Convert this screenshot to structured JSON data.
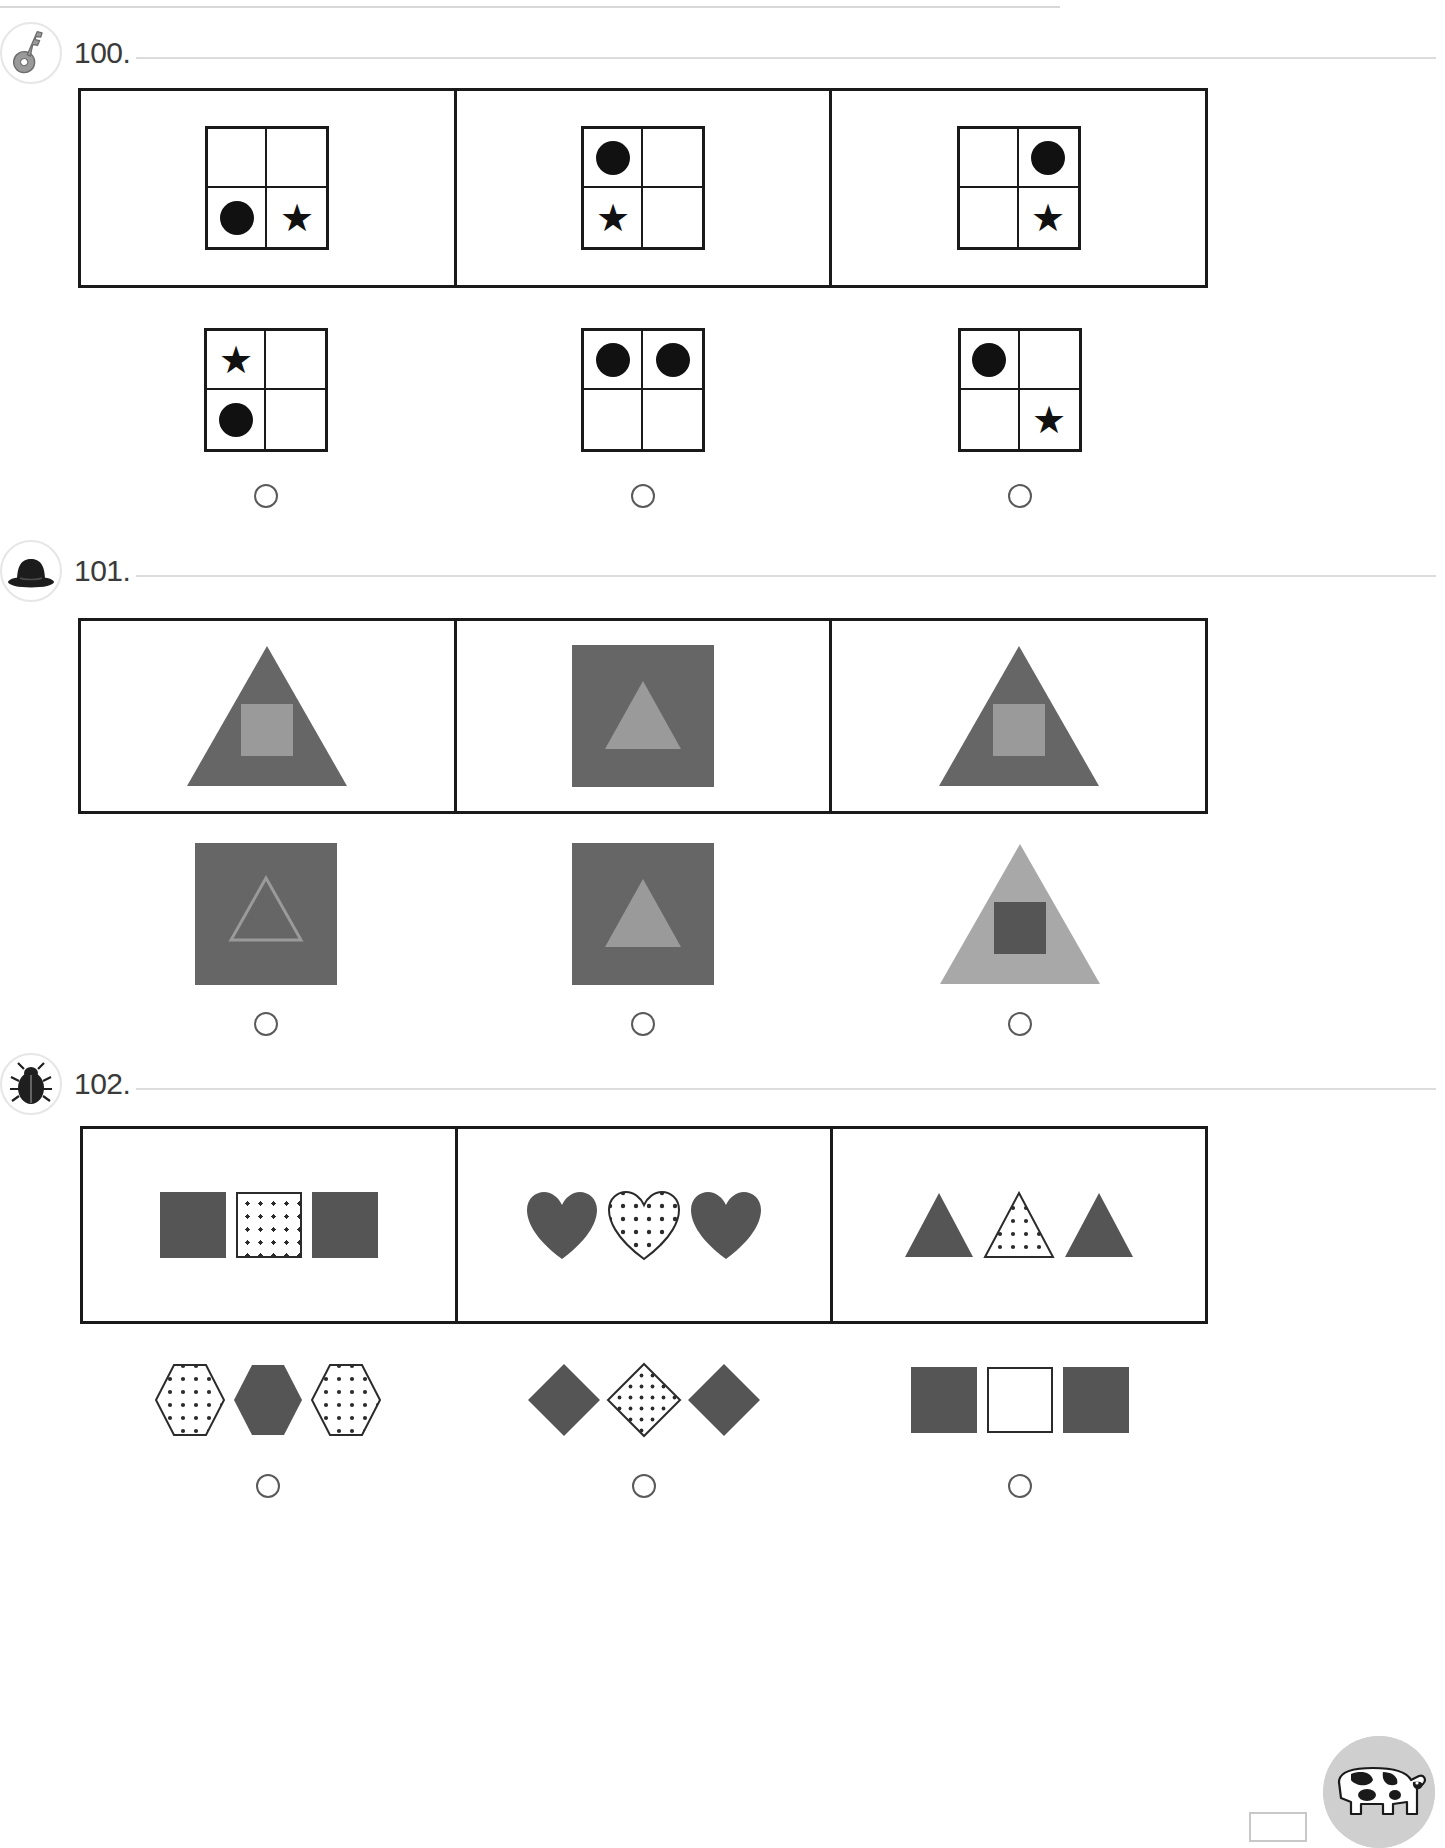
{
  "page": {
    "width": 1445,
    "height": 1848,
    "background": "#ffffff",
    "rule_color": "#d8d8d8",
    "frame_color": "#1a1a1a",
    "bubble_color": "#5a5a5a",
    "dark_gray": "#666666",
    "mid_gray": "#9a9a9a",
    "light_gray": "#a8a8a8",
    "shape_gray": "#555555",
    "black": "#111111"
  },
  "footer": {
    "mascot_icon": "cow-icon",
    "page_number_box": ""
  },
  "exercises": [
    {
      "number": "100.",
      "badge_icon": "key-icon",
      "type": "grid-pattern",
      "question_items": [
        {
          "name": "grid-q1",
          "cells": [
            {
              "pos": "top-left",
              "shape": "empty"
            },
            {
              "pos": "top-right",
              "shape": "empty"
            },
            {
              "pos": "bottom-left",
              "shape": "circle"
            },
            {
              "pos": "bottom-right",
              "shape": "star"
            }
          ]
        },
        {
          "name": "grid-q2",
          "cells": [
            {
              "pos": "top-left",
              "shape": "circle"
            },
            {
              "pos": "top-right",
              "shape": "empty"
            },
            {
              "pos": "bottom-left",
              "shape": "star"
            },
            {
              "pos": "bottom-right",
              "shape": "empty"
            }
          ]
        },
        {
          "name": "grid-q3",
          "cells": [
            {
              "pos": "top-left",
              "shape": "empty"
            },
            {
              "pos": "top-right",
              "shape": "circle"
            },
            {
              "pos": "bottom-left",
              "shape": "empty"
            },
            {
              "pos": "bottom-right",
              "shape": "star"
            }
          ]
        }
      ],
      "answer_items": [
        {
          "name": "grid-a1",
          "cells": [
            {
              "pos": "top-left",
              "shape": "star"
            },
            {
              "pos": "top-right",
              "shape": "empty"
            },
            {
              "pos": "bottom-left",
              "shape": "circle"
            },
            {
              "pos": "bottom-right",
              "shape": "empty"
            }
          ]
        },
        {
          "name": "grid-a2",
          "cells": [
            {
              "pos": "top-left",
              "shape": "circle"
            },
            {
              "pos": "top-right",
              "shape": "circle"
            },
            {
              "pos": "bottom-left",
              "shape": "empty"
            },
            {
              "pos": "bottom-right",
              "shape": "empty"
            }
          ]
        },
        {
          "name": "grid-a3",
          "cells": [
            {
              "pos": "top-left",
              "shape": "circle"
            },
            {
              "pos": "top-right",
              "shape": "empty"
            },
            {
              "pos": "bottom-left",
              "shape": "empty"
            },
            {
              "pos": "bottom-right",
              "shape": "star"
            }
          ]
        }
      ]
    },
    {
      "number": "101.",
      "badge_icon": "bowler-hat-icon",
      "type": "shape-inside-shape",
      "question_items": [
        {
          "name": "fig-q1",
          "outer": "triangle",
          "outer_color": "#666666",
          "inner": "square",
          "inner_color": "#9a9a9a"
        },
        {
          "name": "fig-q2",
          "outer": "square",
          "outer_color": "#666666",
          "inner": "triangle",
          "inner_color": "#9a9a9a"
        },
        {
          "name": "fig-q3",
          "outer": "triangle",
          "outer_color": "#666666",
          "inner": "square",
          "inner_color": "#9a9a9a"
        }
      ],
      "answer_items": [
        {
          "name": "fig-a1",
          "outer": "square",
          "outer_color": "#666666",
          "inner": "triangle-outline",
          "inner_color": "#9a9a9a"
        },
        {
          "name": "fig-a2",
          "outer": "square",
          "outer_color": "#666666",
          "inner": "triangle",
          "inner_color": "#9a9a9a"
        },
        {
          "name": "fig-a3",
          "outer": "triangle",
          "outer_color": "#a8a8a8",
          "inner": "square",
          "inner_color": "#555555"
        }
      ]
    },
    {
      "number": "102.",
      "badge_icon": "beetle-icon",
      "type": "triplet-fill-pattern",
      "question_items": [
        {
          "name": "trip-q1",
          "shape": "square",
          "fills": [
            "solid",
            "dotted",
            "solid"
          ]
        },
        {
          "name": "trip-q2",
          "shape": "heart",
          "fills": [
            "solid",
            "dotted",
            "solid"
          ]
        },
        {
          "name": "trip-q3",
          "shape": "triangle",
          "fills": [
            "solid",
            "dotted",
            "solid"
          ]
        }
      ],
      "answer_items": [
        {
          "name": "trip-a1",
          "shape": "hexagon",
          "fills": [
            "dotted",
            "solid",
            "dotted"
          ]
        },
        {
          "name": "trip-a2",
          "shape": "diamond",
          "fills": [
            "solid",
            "dotted",
            "solid"
          ]
        },
        {
          "name": "trip-a3",
          "shape": "square",
          "fills": [
            "solid",
            "white",
            "solid"
          ]
        }
      ]
    }
  ]
}
